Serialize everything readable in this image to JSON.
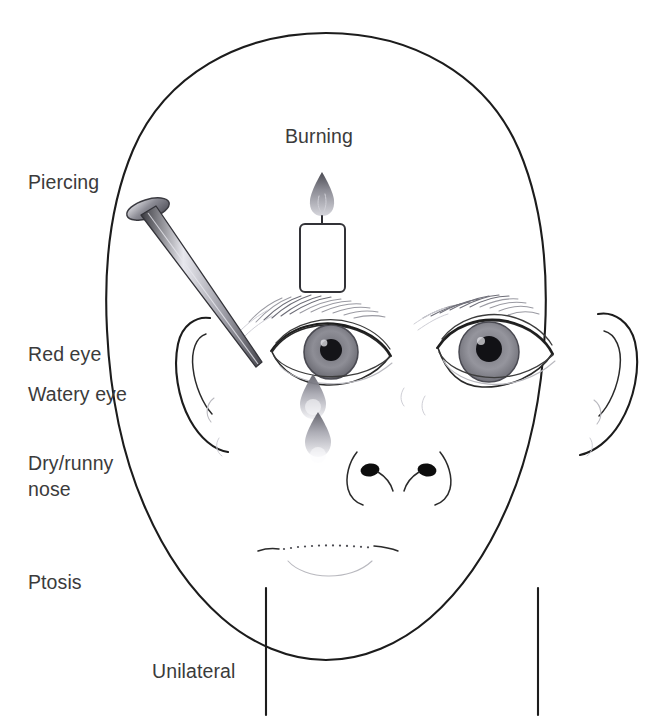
{
  "figure": {
    "background_color": "#ffffff",
    "line_color": "#1c1c1c",
    "text_color": "#3b3b3b"
  },
  "labels": {
    "piercing": "Piercing",
    "burning": "Burning",
    "red_eye": "Red eye",
    "watery_eye": "Watery eye",
    "dry_runny_nose_line1": "Dry/runny",
    "dry_runny_nose_line2": "nose",
    "ptosis": "Ptosis",
    "unilateral": "Unilateral"
  },
  "icons": {
    "candle": "candle-icon",
    "flame": "flame-icon",
    "nail": "nail-icon",
    "tear_upper": "teardrop-icon",
    "tear_lower": "teardrop-icon"
  },
  "anatomy": {
    "head": "head-outline",
    "left_ear": "ear-left",
    "right_ear": "ear-right",
    "left_eye": "eye-left",
    "right_eye": "eye-right",
    "left_eyebrow": "eyebrow-left",
    "right_eyebrow": "eyebrow-right",
    "nose": "nose",
    "mouth": "mouth",
    "neck": "neck"
  }
}
